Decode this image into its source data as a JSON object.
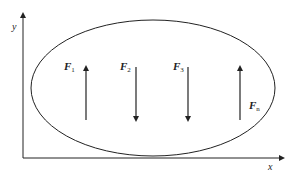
{
  "diagram": {
    "axes": {
      "x_label": "x",
      "y_label": "y"
    },
    "region": {
      "shape": "ellipse",
      "cx": 153,
      "cy": 88,
      "rx": 122,
      "ry": 68
    },
    "forces": [
      {
        "label": "F",
        "subscript": "1",
        "direction": "up",
        "x": 86,
        "y_top": 68,
        "y_bottom": 120
      },
      {
        "label": "F",
        "subscript": "2",
        "direction": "down",
        "x": 136,
        "y_top": 68,
        "y_bottom": 120
      },
      {
        "label": "F",
        "subscript": "3",
        "direction": "down",
        "x": 188,
        "y_top": 68,
        "y_bottom": 120
      },
      {
        "label": "F",
        "subscript": "n",
        "direction": "up",
        "x": 240,
        "y_top": 68,
        "y_bottom": 120
      }
    ],
    "colors": {
      "stroke": "#222222",
      "background": "#ffffff"
    }
  }
}
